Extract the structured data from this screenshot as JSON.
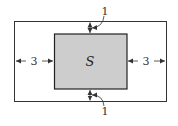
{
  "diagram": {
    "inner_label": "S",
    "left_dim": "3",
    "right_dim": "3",
    "top_dim": "1",
    "bottom_dim": "1",
    "colors": {
      "outline": "#333333",
      "inner_fill": "#cccccc",
      "background": "#ffffff"
    }
  }
}
